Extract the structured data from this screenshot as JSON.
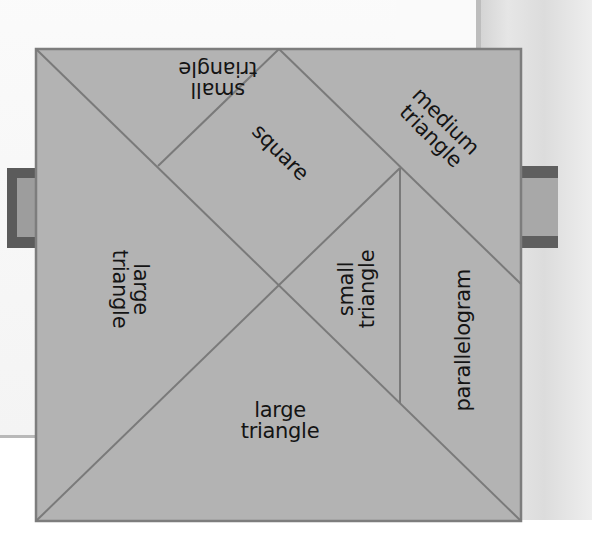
{
  "diagram": {
    "type": "tangram",
    "colors": {
      "piece_fill": "#b3b3b3",
      "edge": "#7a7a7a",
      "text": "#141414",
      "tab_dark": "#5b5b5b",
      "tab_light": "#a3a3a3"
    },
    "pieces": [
      {
        "id": "small-triangle-top",
        "line1": "small",
        "line2": "triangle",
        "rotation": 180
      },
      {
        "id": "square",
        "line1": "square",
        "rotation": 45
      },
      {
        "id": "medium-triangle",
        "line1": "medium",
        "line2": "triangle",
        "rotation": 45
      },
      {
        "id": "large-triangle-left",
        "line1": "large",
        "line2": "triangle",
        "rotation": 90
      },
      {
        "id": "small-triangle-middle",
        "line1": "small",
        "line2": "triangle",
        "rotation": -90
      },
      {
        "id": "parallelogram",
        "line1": "parallelogram",
        "rotation": -90
      },
      {
        "id": "large-triangle-bottom",
        "line1": "large",
        "line2": "triangle",
        "rotation": 0
      }
    ]
  }
}
